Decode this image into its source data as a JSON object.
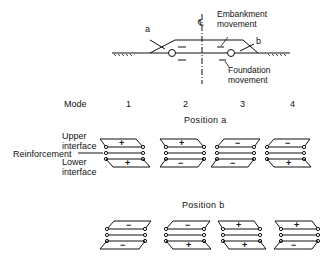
{
  "embankment": {
    "label_a": "a",
    "label_b": "b",
    "centerline_symbol": "℄",
    "embankment_movement": [
      "Embankment",
      "movement"
    ],
    "foundation_movement": [
      "Foundation",
      "movement"
    ]
  },
  "modes": {
    "label": "Mode",
    "numbers": [
      "1",
      "2",
      "3",
      "4"
    ]
  },
  "legend": {
    "upper_interface": [
      "Upper",
      "interface"
    ],
    "reinforcement": "Reinforcement",
    "lower_interface": [
      "Lower",
      "interface"
    ]
  },
  "position_a": {
    "title": "Position a",
    "modes": [
      {
        "upper": "+",
        "lower": "+"
      },
      {
        "upper": "+",
        "lower": "−"
      },
      {
        "upper": "−",
        "lower": "−"
      },
      {
        "upper": "−",
        "lower": "+"
      }
    ]
  },
  "position_b": {
    "title": "Position b",
    "modes": [
      {
        "upper": "−",
        "lower": "−"
      },
      {
        "upper": "−",
        "lower": "+"
      },
      {
        "upper": "+",
        "lower": "+"
      },
      {
        "upper": "+",
        "lower": "−"
      }
    ]
  }
}
